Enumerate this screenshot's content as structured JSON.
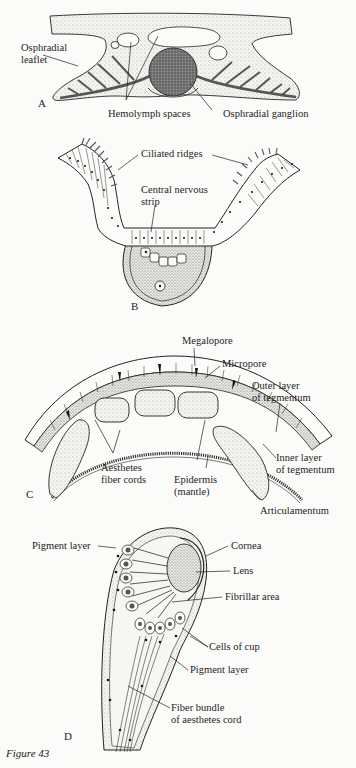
{
  "figure": {
    "caption": "Figure 43",
    "colors": {
      "ink": "#1e1e1e",
      "paper": "#fbfbf9",
      "stipple": "#777777",
      "ganglion": "#6b6b6b"
    }
  },
  "panels": [
    {
      "id": "A",
      "letter": "A",
      "labels": [
        "Osphradial",
        "leaflet",
        "Hemolymph spaces",
        "Osphradial ganglion"
      ]
    },
    {
      "id": "B",
      "letter": "B",
      "labels": [
        "Ciliated ridges",
        "Central nervous",
        "strip"
      ]
    },
    {
      "id": "C",
      "letter": "C",
      "labels": [
        "Megalopore",
        "Micropore",
        "Outer layer",
        "of tegmentum",
        "Inner layer",
        "of tegmentum",
        "Aesthetes",
        "fiber cords",
        "Epidermis",
        "(mantle)",
        "Articulamentum"
      ]
    },
    {
      "id": "D",
      "letter": "D",
      "labels": [
        "Pigment layer",
        "Cornea",
        "Lens",
        "Fibrillar area",
        "Cells of cup",
        "Pigment layer",
        "Fiber bundle",
        "of aesthetes cord"
      ]
    }
  ]
}
